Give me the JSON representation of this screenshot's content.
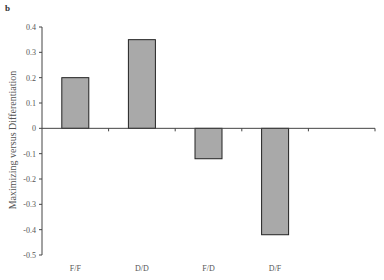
{
  "panel_label": "b",
  "chart_data": {
    "type": "bar",
    "title": "",
    "xlabel": "",
    "ylabel": "Maximizing versus Differentiation",
    "categories": [
      "F/F",
      "D/D",
      "F/D",
      "D/F"
    ],
    "values": [
      0.2,
      0.35,
      -0.12,
      -0.42
    ],
    "ylim": [
      -0.5,
      0.4
    ],
    "yticks": [
      0.4,
      0.3,
      0.2,
      0.1,
      0,
      -0.1,
      -0.2,
      -0.3,
      -0.4,
      -0.5
    ],
    "ytick_labels": [
      "0.4",
      "0.3",
      "0.2",
      "0.1",
      "0",
      "-0.1",
      "-0.2",
      "-0.3",
      "-0.4",
      "-0.5"
    ],
    "n_category_slots": 5,
    "grid": false,
    "legend": null,
    "bar_color": "#a9a9a9",
    "bar_edge_color": "#222222",
    "axis_color": "#444444"
  }
}
